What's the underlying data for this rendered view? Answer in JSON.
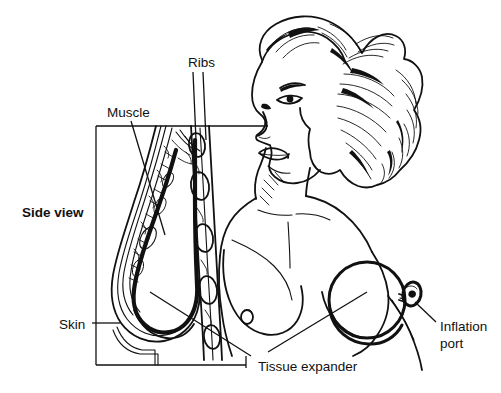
{
  "figure": {
    "background_color": "#ffffff",
    "ink_color": "#111111",
    "width": 501,
    "height": 393
  },
  "labels": {
    "side_view": "Side view",
    "ribs": "Ribs",
    "muscle": "Muscle",
    "skin": "Skin",
    "tissue_expander": "Tissue expander",
    "inflation_port_line1": "Inflation",
    "inflation_port_line2": "port"
  },
  "diagram": {
    "side_view_box": {
      "x": 96,
      "y": 126,
      "width": 149,
      "height": 239
    },
    "anatomy_parts": [
      "skin-layer",
      "muscle-layer",
      "rib-cross-sections",
      "breast-mound",
      "sternum"
    ],
    "front_view_parts": [
      "head-and-hair",
      "face",
      "neck",
      "torso",
      "left-breast",
      "tissue-expander-disc",
      "inflation-tube",
      "inflation-port-disc"
    ],
    "tissue_expander": {
      "cx": 367,
      "cy": 300,
      "r": 38
    },
    "inflation_port": {
      "cx": 412,
      "cy": 294,
      "rx": 9,
      "ry": 12
    }
  }
}
